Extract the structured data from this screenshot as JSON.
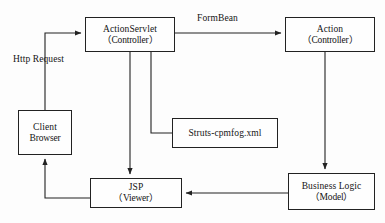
{
  "diagram": {
    "stroke_color": "#222222",
    "background_color": "#fdfdfd",
    "text_color": "#141414",
    "nodes": [
      {
        "id": "actionservlet",
        "line1": "ActionServlet",
        "line2": "（Controller）"
      },
      {
        "id": "action",
        "line1": "Action",
        "line2": "（Controller）"
      },
      {
        "id": "client",
        "line1": "Client",
        "line2": "Browser"
      },
      {
        "id": "struts",
        "line1": "Struts-cpmfog.xml",
        "line2": ""
      },
      {
        "id": "jsp",
        "line1": "JSP",
        "line2": "（Viewer）"
      },
      {
        "id": "business",
        "line1": "Business Logic",
        "line2": "（Model）"
      }
    ],
    "edge_labels": [
      {
        "id": "formbean",
        "text": "FormBean"
      },
      {
        "id": "http_request",
        "text": "Http Request"
      }
    ],
    "edges": [
      {
        "from": "client",
        "to": "actionservlet",
        "label": "Http Request",
        "arrow": true
      },
      {
        "from": "actionservlet",
        "to": "action",
        "label": "FormBean",
        "arrow": true
      },
      {
        "from": "actionservlet",
        "to": "jsp",
        "label": "",
        "arrow": true
      },
      {
        "from": "actionservlet",
        "to": "struts",
        "label": "",
        "arrow": false
      },
      {
        "from": "action",
        "to": "business",
        "label": "",
        "arrow": true
      },
      {
        "from": "business",
        "to": "jsp",
        "label": "",
        "arrow": true
      },
      {
        "from": "jsp",
        "to": "client",
        "label": "",
        "arrow": true
      }
    ]
  }
}
